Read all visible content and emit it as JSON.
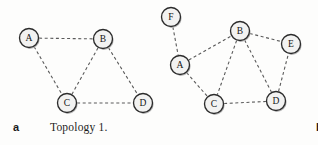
{
  "figure": {
    "width": 318,
    "height": 145,
    "background_color": "#fdfdfc"
  },
  "style": {
    "node_fill": "#f2f2f1",
    "node_stroke": "#2b2b2b",
    "edge_stroke": "#5a5a5a",
    "edge_dash": "dashed",
    "node_radius": 9.5,
    "text_color": "#1d1d1d"
  },
  "chart_data": [
    {
      "type": "diagram",
      "graph_type": "undirected-network-topology",
      "panel_letter": "a",
      "title": "Topology 1.",
      "node_count": 4,
      "edge_count": 5,
      "nodes": [
        {
          "id": "A",
          "label": "A",
          "x": 29,
          "y": 38
        },
        {
          "id": "B",
          "label": "B",
          "x": 103,
          "y": 39
        },
        {
          "id": "C",
          "label": "C",
          "x": 67,
          "y": 103
        },
        {
          "id": "D",
          "label": "D",
          "x": 143,
          "y": 103
        }
      ],
      "edges": [
        {
          "source": "A",
          "target": "B"
        },
        {
          "source": "A",
          "target": "C"
        },
        {
          "source": "B",
          "target": "C"
        },
        {
          "source": "B",
          "target": "D"
        },
        {
          "source": "C",
          "target": "D"
        }
      ]
    },
    {
      "type": "diagram",
      "graph_type": "undirected-network-topology",
      "panel_letter": "b",
      "title": "Topology 2.",
      "node_count": 6,
      "edge_count": 8,
      "nodes": [
        {
          "id": "F",
          "label": "F",
          "x": 12,
          "y": 17
        },
        {
          "id": "B",
          "label": "B",
          "x": 81,
          "y": 31
        },
        {
          "id": "E",
          "label": "E",
          "x": 132,
          "y": 44
        },
        {
          "id": "A",
          "label": "A",
          "x": 21,
          "y": 65
        },
        {
          "id": "C",
          "label": "C",
          "x": 55,
          "y": 104
        },
        {
          "id": "D",
          "label": "D",
          "x": 117,
          "y": 101
        }
      ],
      "edges": [
        {
          "source": "F",
          "target": "A"
        },
        {
          "source": "A",
          "target": "B"
        },
        {
          "source": "A",
          "target": "C"
        },
        {
          "source": "B",
          "target": "C"
        },
        {
          "source": "B",
          "target": "D"
        },
        {
          "source": "B",
          "target": "E"
        },
        {
          "source": "C",
          "target": "D"
        },
        {
          "source": "D",
          "target": "E"
        }
      ]
    }
  ],
  "panels": {
    "a": {
      "letter": "a",
      "caption": "Topology 1."
    },
    "b": {
      "letter": "b",
      "caption": "Topology 2."
    }
  }
}
